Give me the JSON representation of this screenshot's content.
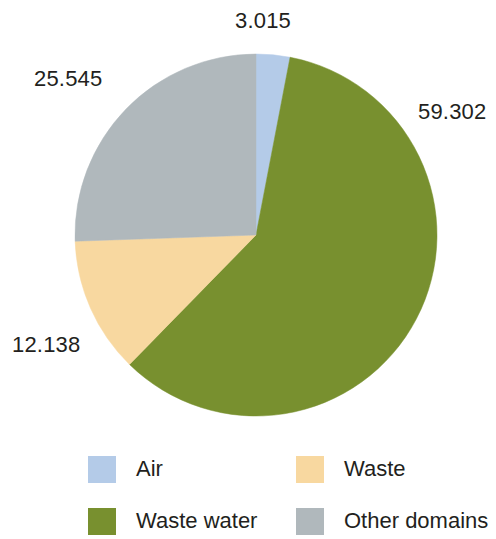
{
  "chart_data": {
    "type": "pie",
    "title": "",
    "subtitle": "",
    "categories": [
      "Air",
      "Waste water",
      "Waste",
      "Other domains"
    ],
    "values": [
      3.015,
      59.302,
      12.138,
      25.545
    ],
    "value_labels": [
      "3.015",
      "59.302",
      "12.138",
      "25.545"
    ],
    "colors": [
      "#b4cbe8",
      "#78902f",
      "#f8d8a0",
      "#b0b8bc"
    ],
    "start_angle_deg": 0,
    "direction": "clockwise",
    "total": 100.0,
    "units": "percent",
    "legend_position": "bottom",
    "grid": false,
    "slices": [
      {
        "name": "Air",
        "value": 3.015,
        "label": "3.015",
        "color": "#b4cbe8"
      },
      {
        "name": "Waste water",
        "value": 59.302,
        "label": "59.302",
        "color": "#78902f"
      },
      {
        "name": "Waste",
        "value": 12.138,
        "label": "12.138",
        "color": "#f8d8a0"
      },
      {
        "name": "Other domains",
        "value": 25.545,
        "label": "25.545",
        "color": "#b0b8bc"
      }
    ]
  },
  "labels": {
    "air": "3.015",
    "waste_water": "59.302",
    "waste": "12.138",
    "other_domains": "25.545"
  },
  "legend": {
    "items": [
      {
        "label": "Air",
        "color": "#b4cbe8"
      },
      {
        "label": "Waste",
        "color": "#f8d8a0"
      },
      {
        "label": "Waste water",
        "color": "#78902f"
      },
      {
        "label": "Other domains",
        "color": "#b0b8bc"
      }
    ]
  }
}
